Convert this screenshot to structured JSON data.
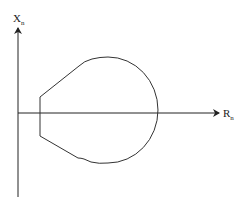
{
  "diagram": {
    "type": "impedance-plane relay characteristic",
    "axes": {
      "y_axis": {
        "label": "X",
        "subscript": "n"
      },
      "x_axis": {
        "label": "R",
        "subscript": "n"
      }
    },
    "colors": {
      "line": "#333333",
      "axis": "#222222",
      "background": "#ffffff"
    }
  }
}
